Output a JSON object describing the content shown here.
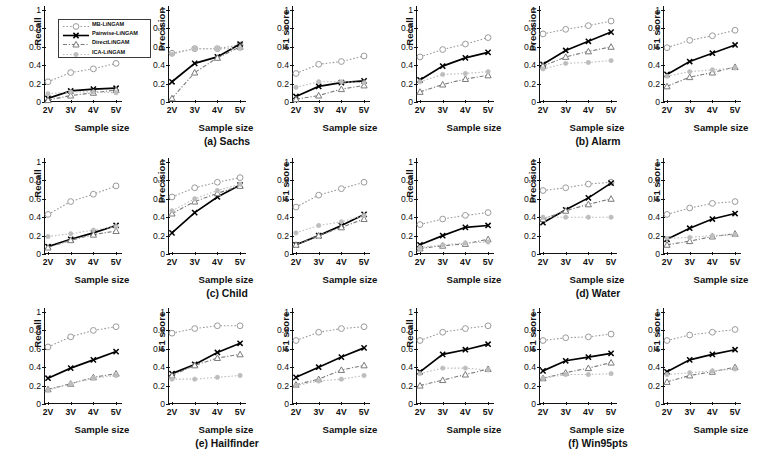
{
  "figure": {
    "xaxis_title": "Sample size",
    "x_categories": [
      "2V",
      "3V",
      "4V",
      "5V"
    ],
    "y_ticks": [
      "0",
      "0.2",
      "0.4",
      "0.6",
      "0.8",
      "1"
    ],
    "ylim": [
      0,
      1
    ],
    "legend": {
      "entries": [
        {
          "label": "MB-LiNGAM",
          "marker": "circle",
          "color": "#9a9a9a",
          "dash": "dotted"
        },
        {
          "label": "Pairwise-LiNGAM",
          "marker": "cross",
          "color": "#000000",
          "dash": "solid"
        },
        {
          "label": "DirectLiNGAM",
          "marker": "triangle",
          "color": "#7a7a7a",
          "dash": "dashdot"
        },
        {
          "label": "ICA-LiNGAM",
          "marker": "dot",
          "color": "#bdbdbd",
          "dash": "dotted"
        }
      ]
    },
    "captions": [
      "(a) Sachs",
      "(b) Alarm",
      "(c) Child",
      "(d) Water",
      "(e) Hailfinder",
      "(f) Win95pts"
    ]
  },
  "chart_data": [
    {
      "type": "line",
      "panel": 1,
      "dataset": "Sachs",
      "ylabel": "Recall",
      "xlabel": "Sample size",
      "categories": [
        "2V",
        "3V",
        "4V",
        "5V"
      ],
      "ylim": [
        0,
        1
      ],
      "grid": false,
      "series": [
        {
          "name": "MB-LiNGAM",
          "values": [
            0.22,
            0.32,
            0.36,
            0.42
          ]
        },
        {
          "name": "Pairwise-LiNGAM",
          "values": [
            0.04,
            0.12,
            0.14,
            0.15
          ]
        },
        {
          "name": "DirectLiNGAM",
          "values": [
            0.02,
            0.07,
            0.1,
            0.13
          ]
        },
        {
          "name": "ICA-LiNGAM",
          "values": [
            0.09,
            0.11,
            0.11,
            0.1
          ]
        }
      ]
    },
    {
      "type": "line",
      "panel": 2,
      "dataset": "Sachs",
      "ylabel": "Precision",
      "xlabel": "Sample size",
      "categories": [
        "2V",
        "3V",
        "4V",
        "5V"
      ],
      "ylim": [
        0,
        1
      ],
      "grid": false,
      "series": [
        {
          "name": "MB-LiNGAM",
          "values": [
            0.53,
            0.58,
            0.58,
            0.62
          ]
        },
        {
          "name": "Pairwise-LiNGAM",
          "values": [
            0.22,
            0.42,
            0.49,
            0.63
          ]
        },
        {
          "name": "DirectLiNGAM",
          "values": [
            0.04,
            0.32,
            0.48,
            0.6
          ]
        },
        {
          "name": "ICA-LiNGAM",
          "values": [
            0.52,
            0.58,
            0.58,
            0.58
          ]
        }
      ]
    },
    {
      "type": "line",
      "panel": 3,
      "dataset": "Sachs",
      "ylabel": "F1 score",
      "xlabel": "Sample size",
      "categories": [
        "2V",
        "3V",
        "4V",
        "5V"
      ],
      "ylim": [
        0,
        1
      ],
      "grid": false,
      "series": [
        {
          "name": "MB-LiNGAM",
          "values": [
            0.31,
            0.41,
            0.44,
            0.5
          ]
        },
        {
          "name": "Pairwise-LiNGAM",
          "values": [
            0.06,
            0.17,
            0.21,
            0.23
          ]
        },
        {
          "name": "DirectLiNGAM",
          "values": [
            0.03,
            0.07,
            0.14,
            0.18
          ]
        },
        {
          "name": "ICA-LiNGAM",
          "values": [
            0.16,
            0.22,
            0.22,
            0.21
          ]
        }
      ]
    },
    {
      "type": "line",
      "panel": 4,
      "dataset": "Alarm",
      "ylabel": "Recall",
      "xlabel": "Sample size",
      "categories": [
        "2V",
        "3V",
        "4V",
        "5V"
      ],
      "ylim": [
        0,
        1
      ],
      "grid": false,
      "series": [
        {
          "name": "MB-LiNGAM",
          "values": [
            0.49,
            0.57,
            0.63,
            0.7
          ]
        },
        {
          "name": "Pairwise-LiNGAM",
          "values": [
            0.24,
            0.39,
            0.48,
            0.54
          ]
        },
        {
          "name": "DirectLiNGAM",
          "values": [
            0.11,
            0.19,
            0.25,
            0.29
          ]
        },
        {
          "name": "ICA-LiNGAM",
          "values": [
            0.22,
            0.3,
            0.31,
            0.33
          ]
        }
      ]
    },
    {
      "type": "line",
      "panel": 5,
      "dataset": "Alarm",
      "ylabel": "Precision",
      "xlabel": "Sample size",
      "categories": [
        "2V",
        "3V",
        "4V",
        "5V"
      ],
      "ylim": [
        0,
        1
      ],
      "grid": false,
      "series": [
        {
          "name": "MB-LiNGAM",
          "values": [
            0.74,
            0.79,
            0.83,
            0.88
          ]
        },
        {
          "name": "Pairwise-LiNGAM",
          "values": [
            0.41,
            0.56,
            0.66,
            0.76
          ]
        },
        {
          "name": "DirectLiNGAM",
          "values": [
            0.39,
            0.49,
            0.55,
            0.6
          ]
        },
        {
          "name": "ICA-LiNGAM",
          "values": [
            0.36,
            0.42,
            0.43,
            0.45
          ]
        }
      ]
    },
    {
      "type": "line",
      "panel": 6,
      "dataset": "Alarm",
      "ylabel": "F1 score",
      "xlabel": "Sample size",
      "categories": [
        "2V",
        "3V",
        "4V",
        "5V"
      ],
      "ylim": [
        0,
        1
      ],
      "grid": false,
      "series": [
        {
          "name": "MB-LiNGAM",
          "values": [
            0.59,
            0.67,
            0.72,
            0.78
          ]
        },
        {
          "name": "Pairwise-LiNGAM",
          "values": [
            0.3,
            0.44,
            0.53,
            0.62
          ]
        },
        {
          "name": "DirectLiNGAM",
          "values": [
            0.17,
            0.27,
            0.32,
            0.38
          ]
        },
        {
          "name": "ICA-LiNGAM",
          "values": [
            0.28,
            0.33,
            0.35,
            0.37
          ]
        }
      ]
    },
    {
      "type": "line",
      "panel": 7,
      "dataset": "Child",
      "ylabel": "Recall",
      "xlabel": "Sample size",
      "categories": [
        "2V",
        "3V",
        "4V",
        "5V"
      ],
      "ylim": [
        0,
        1
      ],
      "grid": false,
      "series": [
        {
          "name": "MB-LiNGAM",
          "values": [
            0.43,
            0.57,
            0.65,
            0.74
          ]
        },
        {
          "name": "Pairwise-LiNGAM",
          "values": [
            0.08,
            0.16,
            0.23,
            0.31
          ]
        },
        {
          "name": "DirectLiNGAM",
          "values": [
            0.07,
            0.15,
            0.21,
            0.25
          ]
        },
        {
          "name": "ICA-LiNGAM",
          "values": [
            0.19,
            0.22,
            0.26,
            0.3
          ]
        }
      ]
    },
    {
      "type": "line",
      "panel": 8,
      "dataset": "Child",
      "ylabel": "Precision",
      "xlabel": "Sample size",
      "categories": [
        "2V",
        "3V",
        "4V",
        "5V"
      ],
      "ylim": [
        0,
        1
      ],
      "grid": false,
      "series": [
        {
          "name": "MB-LiNGAM",
          "values": [
            0.62,
            0.72,
            0.78,
            0.83
          ]
        },
        {
          "name": "Pairwise-LiNGAM",
          "values": [
            0.23,
            0.45,
            0.62,
            0.75
          ]
        },
        {
          "name": "DirectLiNGAM",
          "values": [
            0.44,
            0.57,
            0.66,
            0.74
          ]
        },
        {
          "name": "ICA-LiNGAM",
          "values": [
            0.47,
            0.6,
            0.69,
            0.76
          ]
        }
      ]
    },
    {
      "type": "line",
      "panel": 9,
      "dataset": "Child",
      "ylabel": "F1 score",
      "xlabel": "Sample size",
      "categories": [
        "2V",
        "3V",
        "4V",
        "5V"
      ],
      "ylim": [
        0,
        1
      ],
      "grid": false,
      "series": [
        {
          "name": "MB-LiNGAM",
          "values": [
            0.51,
            0.64,
            0.71,
            0.78
          ]
        },
        {
          "name": "Pairwise-LiNGAM",
          "values": [
            0.1,
            0.2,
            0.31,
            0.43
          ]
        },
        {
          "name": "DirectLiNGAM",
          "values": [
            0.1,
            0.2,
            0.29,
            0.38
          ]
        },
        {
          "name": "ICA-LiNGAM",
          "values": [
            0.23,
            0.31,
            0.35,
            0.42
          ]
        }
      ]
    },
    {
      "type": "line",
      "panel": 10,
      "dataset": "Water",
      "ylabel": "Recall",
      "xlabel": "Sample size",
      "categories": [
        "2V",
        "3V",
        "4V",
        "5V"
      ],
      "ylim": [
        0,
        1
      ],
      "grid": false,
      "series": [
        {
          "name": "MB-LiNGAM",
          "values": [
            0.32,
            0.38,
            0.42,
            0.45
          ]
        },
        {
          "name": "Pairwise-LiNGAM",
          "values": [
            0.1,
            0.2,
            0.29,
            0.31
          ]
        },
        {
          "name": "DirectLiNGAM",
          "values": [
            0.06,
            0.09,
            0.11,
            0.16
          ]
        },
        {
          "name": "ICA-LiNGAM",
          "values": [
            0.07,
            0.1,
            0.12,
            0.13
          ]
        }
      ]
    },
    {
      "type": "line",
      "panel": 11,
      "dataset": "Water",
      "ylabel": "Precision",
      "xlabel": "Sample size",
      "categories": [
        "2V",
        "3V",
        "4V",
        "5V"
      ],
      "ylim": [
        0,
        1
      ],
      "grid": false,
      "series": [
        {
          "name": "MB-LiNGAM",
          "values": [
            0.69,
            0.72,
            0.76,
            0.78
          ]
        },
        {
          "name": "Pairwise-LiNGAM",
          "values": [
            0.34,
            0.48,
            0.61,
            0.77
          ]
        },
        {
          "name": "DirectLiNGAM",
          "values": [
            0.38,
            0.47,
            0.54,
            0.6
          ]
        },
        {
          "name": "ICA-LiNGAM",
          "values": [
            0.4,
            0.4,
            0.4,
            0.4
          ]
        }
      ]
    },
    {
      "type": "line",
      "panel": 12,
      "dataset": "Water",
      "ylabel": "F1 score",
      "xlabel": "Sample size",
      "categories": [
        "2V",
        "3V",
        "4V",
        "5V"
      ],
      "ylim": [
        0,
        1
      ],
      "grid": false,
      "series": [
        {
          "name": "MB-LiNGAM",
          "values": [
            0.43,
            0.5,
            0.55,
            0.57
          ]
        },
        {
          "name": "Pairwise-LiNGAM",
          "values": [
            0.16,
            0.28,
            0.38,
            0.44
          ]
        },
        {
          "name": "DirectLiNGAM",
          "values": [
            0.1,
            0.14,
            0.19,
            0.22
          ]
        },
        {
          "name": "ICA-LiNGAM",
          "values": [
            0.17,
            0.18,
            0.2,
            0.21
          ]
        }
      ]
    },
    {
      "type": "line",
      "panel": 13,
      "dataset": "Hailfinder",
      "ylabel": "Recall",
      "xlabel": "Sample size",
      "categories": [
        "2V",
        "3V",
        "4V",
        "5V"
      ],
      "ylim": [
        0,
        1
      ],
      "grid": false,
      "series": [
        {
          "name": "MB-LiNGAM",
          "values": [
            0.62,
            0.73,
            0.8,
            0.84
          ]
        },
        {
          "name": "Pairwise-LiNGAM",
          "values": [
            0.28,
            0.39,
            0.48,
            0.57
          ]
        },
        {
          "name": "DirectLiNGAM",
          "values": [
            0.16,
            0.22,
            0.29,
            0.33
          ]
        },
        {
          "name": "ICA-LiNGAM",
          "values": [
            0.15,
            0.22,
            0.28,
            0.31
          ]
        }
      ]
    },
    {
      "type": "line",
      "panel": 14,
      "dataset": "Hailfinder",
      "ylabel": "F1 score",
      "xlabel": "Sample size",
      "categories": [
        "2V",
        "3V",
        "4V",
        "5V"
      ],
      "ylim": [
        0,
        1
      ],
      "grid": false,
      "series": [
        {
          "name": "MB-LiNGAM",
          "values": [
            0.77,
            0.82,
            0.85,
            0.85
          ]
        },
        {
          "name": "Pairwise-LiNGAM",
          "values": [
            0.33,
            0.43,
            0.56,
            0.66
          ]
        },
        {
          "name": "DirectLiNGAM",
          "values": [
            0.31,
            0.42,
            0.5,
            0.54
          ]
        },
        {
          "name": "ICA-LiNGAM",
          "values": [
            0.27,
            0.27,
            0.29,
            0.31
          ]
        }
      ]
    },
    {
      "type": "line",
      "panel": 15,
      "dataset": "Hailfinder",
      "ylabel": "F1 score",
      "xlabel": "Sample size",
      "categories": [
        "2V",
        "3V",
        "4V",
        "5V"
      ],
      "ylim": [
        0,
        1
      ],
      "grid": false,
      "series": [
        {
          "name": "MB-LiNGAM",
          "values": [
            0.69,
            0.78,
            0.82,
            0.84
          ]
        },
        {
          "name": "Pairwise-LiNGAM",
          "values": [
            0.29,
            0.4,
            0.51,
            0.61
          ]
        },
        {
          "name": "DirectLiNGAM",
          "values": [
            0.21,
            0.27,
            0.37,
            0.42
          ]
        },
        {
          "name": "ICA-LiNGAM",
          "values": [
            0.2,
            0.25,
            0.27,
            0.31
          ]
        }
      ]
    },
    {
      "type": "line",
      "panel": 16,
      "dataset": "Win95pts",
      "ylabel": "Recall",
      "xlabel": "Sample size",
      "categories": [
        "2V",
        "3V",
        "4V",
        "5V"
      ],
      "ylim": [
        0,
        1
      ],
      "grid": false,
      "series": [
        {
          "name": "MB-LiNGAM",
          "values": [
            0.69,
            0.78,
            0.82,
            0.85
          ]
        },
        {
          "name": "Pairwise-LiNGAM",
          "values": [
            0.35,
            0.54,
            0.59,
            0.65
          ]
        },
        {
          "name": "DirectLiNGAM",
          "values": [
            0.2,
            0.26,
            0.32,
            0.38
          ]
        },
        {
          "name": "ICA-LiNGAM",
          "values": [
            0.33,
            0.39,
            0.39,
            0.37
          ]
        }
      ]
    },
    {
      "type": "line",
      "panel": 17,
      "dataset": "Win95pts",
      "ylabel": "F1 score",
      "xlabel": "Sample size",
      "categories": [
        "2V",
        "3V",
        "4V",
        "5V"
      ],
      "ylim": [
        0,
        1
      ],
      "grid": false,
      "series": [
        {
          "name": "MB-LiNGAM",
          "values": [
            0.69,
            0.72,
            0.73,
            0.76
          ]
        },
        {
          "name": "Pairwise-LiNGAM",
          "values": [
            0.36,
            0.47,
            0.51,
            0.55
          ]
        },
        {
          "name": "DirectLiNGAM",
          "values": [
            0.28,
            0.34,
            0.39,
            0.45
          ]
        },
        {
          "name": "ICA-LiNGAM",
          "values": [
            0.28,
            0.32,
            0.32,
            0.33
          ]
        }
      ]
    },
    {
      "type": "line",
      "panel": 18,
      "dataset": "Win95pts",
      "ylabel": "F1 score",
      "xlabel": "Sample size",
      "categories": [
        "2V",
        "3V",
        "4V",
        "5V"
      ],
      "ylim": [
        0,
        1
      ],
      "grid": false,
      "series": [
        {
          "name": "MB-LiNGAM",
          "values": [
            0.69,
            0.75,
            0.78,
            0.81
          ]
        },
        {
          "name": "Pairwise-LiNGAM",
          "values": [
            0.35,
            0.48,
            0.54,
            0.59
          ]
        },
        {
          "name": "DirectLiNGAM",
          "values": [
            0.24,
            0.31,
            0.35,
            0.4
          ]
        },
        {
          "name": "ICA-LiNGAM",
          "values": [
            0.32,
            0.34,
            0.36,
            0.38
          ]
        }
      ]
    }
  ]
}
